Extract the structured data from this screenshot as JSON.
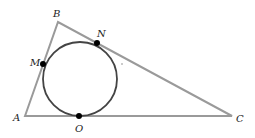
{
  "diagram": {
    "type": "geometry",
    "colors": {
      "triangle": "#9a9a9a",
      "circle": "#444444",
      "points": "#000000",
      "labels": "#222222"
    },
    "vertices": {
      "A": {
        "label": "A",
        "x": 25,
        "y": 116
      },
      "B": {
        "label": "B",
        "x": 58,
        "y": 22
      },
      "C": {
        "label": "C",
        "x": 232,
        "y": 116
      }
    },
    "tangent_points": {
      "M": {
        "label": "M",
        "x": 43,
        "y": 64
      },
      "N": {
        "label": "N",
        "x": 97,
        "y": 43
      },
      "O": {
        "label": "O",
        "x": 79,
        "y": 116
      }
    },
    "circle": {
      "cx": 80,
      "cy": 79,
      "r": 37
    }
  }
}
